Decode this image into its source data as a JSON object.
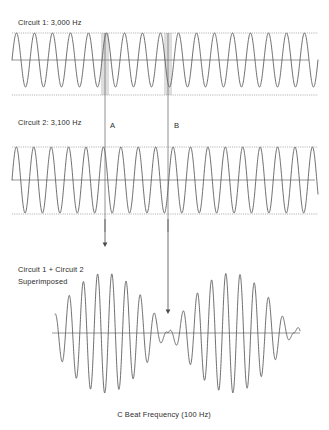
{
  "figure": {
    "title_absent": true,
    "background_color": "#ffffff",
    "wave_color": "#555555",
    "axis_color": "#8a8a8a",
    "marker_color": "#6e6e6e",
    "shade_color": "#c9c9c9"
  },
  "panels": {
    "panel1": {
      "label": "Circuit 1: 3,000 Hz",
      "label_x": 18,
      "label_y": 25,
      "plot": {
        "x0": 12,
        "x1": 318,
        "baseline_y": 60,
        "top_y": 33,
        "bottom_y": 95,
        "amplitude": 27
      },
      "axis_x1": 12,
      "axis_x2": 309
    },
    "panel2": {
      "label": "Circuit 2: 3,100 Hz",
      "label_x": 18,
      "label_y": 125,
      "plot": {
        "x0": 12,
        "x1": 318,
        "baseline_y": 180,
        "top_y": 147,
        "bottom_y": 214,
        "amplitude": 33
      },
      "axis_x1": 12,
      "axis_x2": 315
    },
    "panel3": {
      "label_line1": "Circuit 1 + Circuit 2",
      "label_line2": "Superimposed",
      "label_x": 18,
      "label_y1": 272,
      "label_y2": 284,
      "plot": {
        "x0": 55,
        "x1": 300,
        "baseline_y": 333,
        "amplitude_max": 60
      },
      "axis_x1": 52,
      "axis_x2": 300
    }
  },
  "markers": {
    "a": {
      "label": "A",
      "line_x": 105,
      "label_x": 110,
      "label_y": 128,
      "line_y1": 33,
      "line_y2": 232
    },
    "b": {
      "label": "B",
      "line_x": 168,
      "label_x": 174,
      "label_y": 128,
      "line_y1": 33,
      "line_y2": 232
    }
  },
  "arrows": {
    "a_arrow": {
      "x": 105,
      "y1": 219,
      "y2": 247
    },
    "b_arrow": {
      "x": 168,
      "y1": 219,
      "y2": 314
    }
  },
  "caption": {
    "text": "C Beat Frequency (100 Hz)",
    "x": 164,
    "y": 417
  },
  "chart_data": {
    "type": "line",
    "title": "",
    "caption": "C Beat Frequency (100 Hz)",
    "xlabel": "",
    "ylabel": "",
    "grid": false,
    "legend": "none",
    "annotations": [
      {
        "name": "A",
        "description": "in-phase / constructive point",
        "x_px": 105
      },
      {
        "name": "B",
        "description": "out-of-phase / destructive (beat node) point",
        "x_px": 168
      }
    ],
    "series": [
      {
        "name": "Circuit 1: 3,000 Hz",
        "frequency_hz": 3000,
        "relative_cycles_drawn": 17,
        "amplitude": 1.0,
        "phase_deg": 0,
        "panel": 1
      },
      {
        "name": "Circuit 2: 3,100 Hz",
        "frequency_hz": 3100,
        "relative_cycles_drawn": 17.57,
        "amplitude": 1.0,
        "phase_deg": 0,
        "panel": 2
      },
      {
        "name": "Circuit 1 + Circuit 2 Superimposed",
        "beat_frequency_hz": 100,
        "amplitude": 2.0,
        "panel": 3,
        "description": "Sum of 3000 Hz and 3100 Hz producing 100 Hz beat envelope"
      }
    ]
  }
}
